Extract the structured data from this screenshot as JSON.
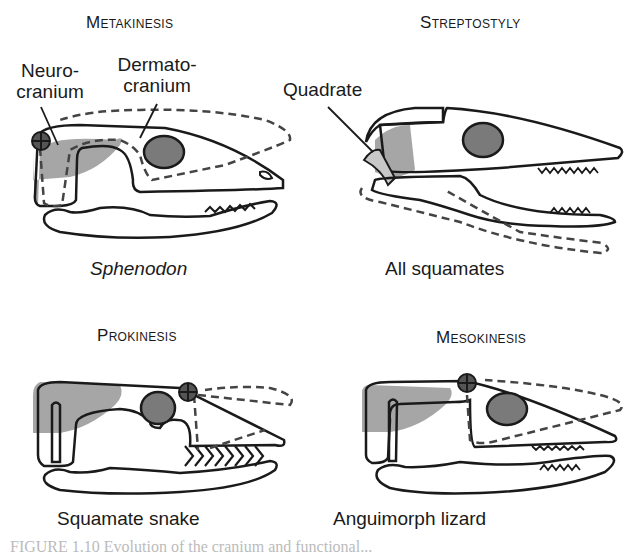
{
  "panels": [
    {
      "id": "metakinesis",
      "title": "Metakinesis",
      "species": "Sphenodon",
      "species_italic": true,
      "labels": [
        "Neuro-\ncranium",
        "Dermato-\ncranium"
      ]
    },
    {
      "id": "streptostyly",
      "title": "Streptostyly",
      "species": "All squamates",
      "labels": [
        "Quadrate"
      ]
    },
    {
      "id": "prokinesis",
      "title": "Prokinesis",
      "species": "Squamate snake"
    },
    {
      "id": "mesokinesis",
      "title": "Mesokinesis",
      "species": "Anguimorph lizard"
    }
  ],
  "colors": {
    "line": "#1a1a1a",
    "dashed": "#444444",
    "neurocranium_fill": "#a6a6a6",
    "orbit_fill": "#7a7a7a",
    "quadrate_fill": "#c8c8c8"
  },
  "caption": "FIGURE 1.10 Evolution of the cranium and functional..."
}
